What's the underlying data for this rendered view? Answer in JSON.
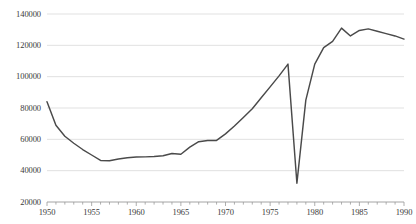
{
  "chart_data": {
    "type": "line",
    "title": "",
    "subtitle": "",
    "xlabel": "",
    "ylabel": "",
    "xlim": [
      1949.3,
      1990.2
    ],
    "ylim": [
      20000,
      143000
    ],
    "grid": true,
    "grid_axis": "y",
    "legend": false,
    "legend_position": "none",
    "line_color": "#4a4a4a",
    "grid_color": "#d9d9d9",
    "axis_color": "#9a9a9a",
    "background_color": "#ffffff",
    "ytick_labels": [
      "20000",
      "40000",
      "60000",
      "80000",
      "100000",
      "120000",
      "140000"
    ],
    "ytick_values": [
      20000,
      40000,
      60000,
      80000,
      100000,
      120000,
      140000
    ],
    "xtick_labels": [
      "1950",
      "1955",
      "1960",
      "1965",
      "1970",
      "1975",
      "1980",
      "1985",
      "1990"
    ],
    "xtick_values": [
      1950,
      1955,
      1960,
      1965,
      1970,
      1975,
      1980,
      1985,
      1990
    ],
    "xminor_step": 1,
    "series": [
      {
        "name": "series-1",
        "color": "#4a4a4a",
        "x": [
          1950,
          1951,
          1952,
          1953,
          1954,
          1955,
          1956,
          1957,
          1958,
          1959,
          1960,
          1961,
          1962,
          1963,
          1964,
          1965,
          1966,
          1967,
          1968,
          1969,
          1970,
          1971,
          1972,
          1973,
          1974,
          1975,
          1976,
          1977,
          1978,
          1979,
          1980,
          1981,
          1982,
          1983,
          1984,
          1985,
          1986,
          1987,
          1988,
          1989,
          1990
        ],
        "values": [
          84000,
          69000,
          62000,
          57500,
          53500,
          50000,
          46500,
          46300,
          47500,
          48300,
          48700,
          48800,
          49000,
          49500,
          51000,
          50500,
          55000,
          58500,
          59200,
          59300,
          63500,
          68500,
          74000,
          79500,
          86500,
          93500,
          100500,
          108000,
          32000,
          85000,
          108000,
          118500,
          122500,
          131000,
          126000,
          129500,
          130500,
          129000,
          127500,
          126000,
          124000
        ]
      }
    ]
  }
}
